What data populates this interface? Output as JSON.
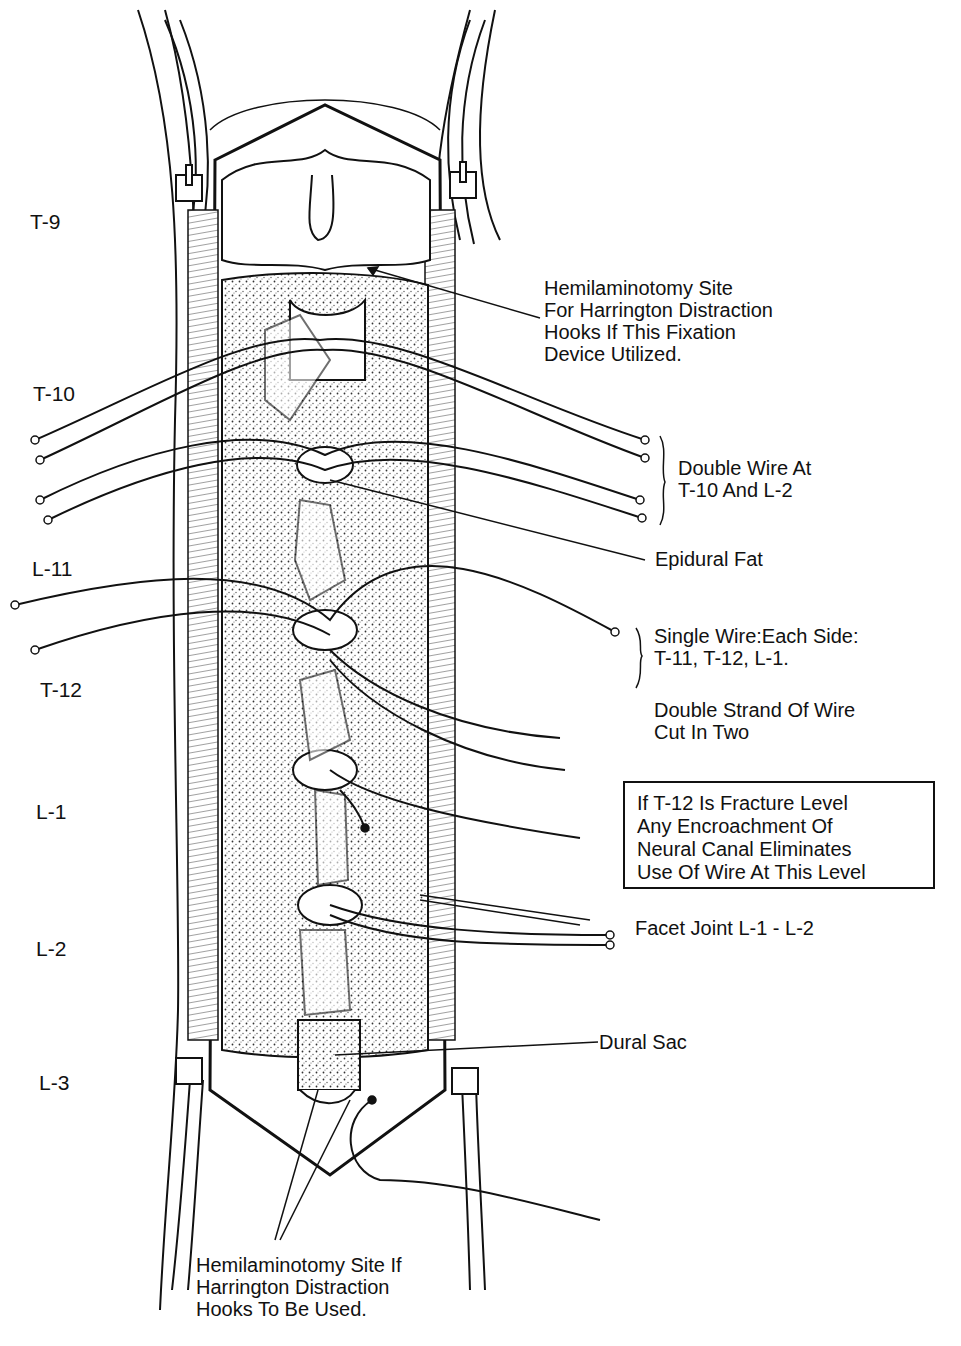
{
  "figure": {
    "vertebral_levels": [
      "T-9",
      "T-10",
      "L-11",
      "T-12",
      "L-1",
      "L-2",
      "L-3"
    ],
    "annotations": {
      "hemilaminotomy_top": "Hemilaminotomy Site\nFor Harrington Distraction\nHooks If This Fixation\nDevice Utilized.",
      "double_wire": "Double Wire At\nT-10 And L-2",
      "epidural_fat": "Epidural Fat",
      "single_wire": "Single Wire:Each Side:\nT-11, T-12, L-1.",
      "double_strand": "Double Strand Of Wire\nCut In Two",
      "fracture_note": "If T-12 Is Fracture Level\nAny Encroachment Of\nNeural Canal Eliminates\nUse Of Wire At This Level",
      "facet_joint": "Facet Joint L-1 - L-2",
      "dural_sac": "Dural Sac",
      "hemilaminotomy_bottom": "Hemilaminotomy Site If\nHarrington Distraction\nHooks To Be Used."
    },
    "colors": {
      "ink": "#111111",
      "paper": "#ffffff",
      "stipple": "#555555"
    }
  }
}
